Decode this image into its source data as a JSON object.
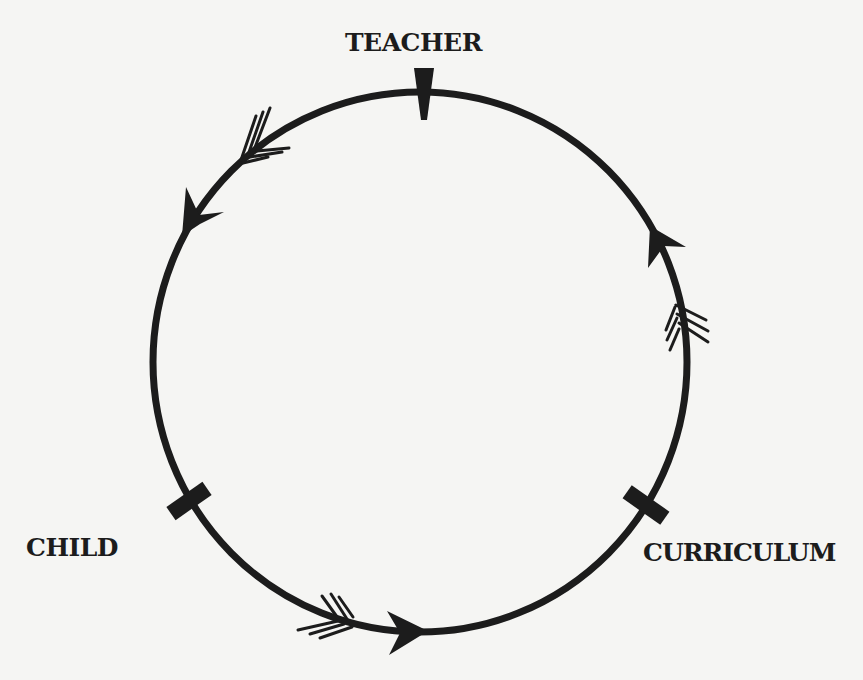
{
  "diagram": {
    "type": "cycle",
    "nodes": [
      {
        "id": "teacher",
        "label": "TEACHER"
      },
      {
        "id": "child",
        "label": "CHILD"
      },
      {
        "id": "curriculum",
        "label": "CURRICULUM"
      }
    ],
    "flow_direction": "counterclockwise",
    "edges": [
      {
        "from": "teacher",
        "to": "child"
      },
      {
        "from": "child",
        "to": "curriculum"
      },
      {
        "from": "curriculum",
        "to": "teacher"
      }
    ],
    "colors": {
      "ink": "#1c1c1c",
      "paper": "#f5f5f3"
    }
  }
}
